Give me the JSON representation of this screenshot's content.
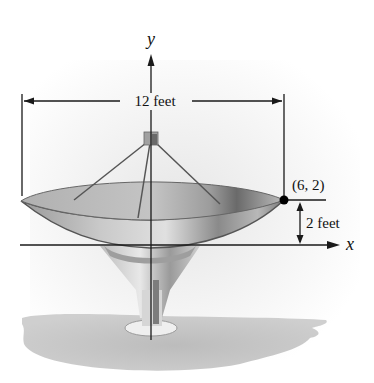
{
  "diagram": {
    "axes": {
      "x_label": "x",
      "y_label": "y"
    },
    "dimensions": {
      "width_label": "12 feet",
      "depth_label": "2 feet"
    },
    "point": {
      "label": "(6, 2)",
      "x": 6,
      "y": 2
    },
    "colors": {
      "line": "#1a1a1a",
      "dish_light": "#d8d8d8",
      "dish_mid": "#a9a9a9",
      "dish_dark": "#6e6e6e",
      "shadow": "#b5b5b5",
      "background_glow": "#e9e9e9"
    }
  }
}
